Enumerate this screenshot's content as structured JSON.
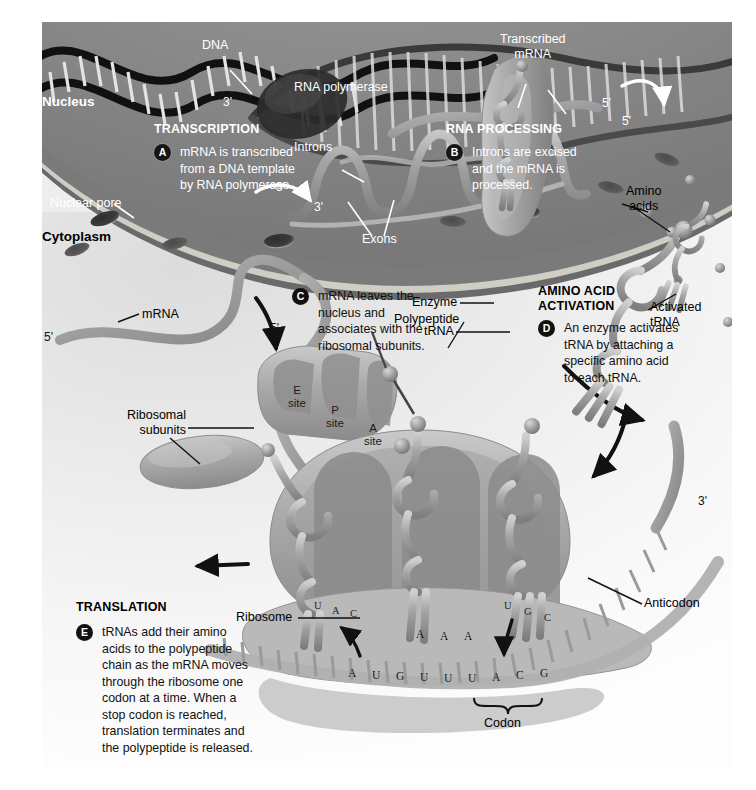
{
  "figure": {
    "background_color": "#ffffff",
    "palette": {
      "nucleus_fill": "#7b7b7b",
      "nuclear_envelope": "#cfcdc4",
      "cytoplasm_fill": "#ebebeb",
      "molecule_gray": "#9a9a9a",
      "text_dark": "#000000",
      "text_light": "#ffffff",
      "badge_fill": "#111111"
    }
  },
  "compartments": [
    {
      "name": "nucleus",
      "label": "Nucleus",
      "text_color": "#ffffff"
    },
    {
      "name": "cytoplasm",
      "label": "Cytoplasm",
      "text_color": "#000000"
    }
  ],
  "steps": [
    {
      "id": "A",
      "heading": "TRANSCRIPTION",
      "body": "mRNA is transcribed\nfrom a DNA template\nby RNA polymerase.",
      "on_dark": true
    },
    {
      "id": "B",
      "heading": "RNA PROCESSING",
      "body": "Introns are excised\nand the mRNA is\nprocessed.",
      "on_dark": true
    },
    {
      "id": "C",
      "heading": "",
      "body": "mRNA leaves the\nnucleus and\nassociates with the\nribosomal subunits.",
      "on_dark": false
    },
    {
      "id": "D",
      "heading": "AMINO ACID\nACTIVATION",
      "body": "An enzyme activates\ntRNA by attaching a\nspecific amino acid\nto each tRNA.",
      "on_dark": false
    },
    {
      "id": "E",
      "heading": "TRANSLATION",
      "body": "tRNAs add their amino\nacids to the polypeptide\nchain as the mRNA moves\nthrough the ribosome one\ncodon at a time. When a\nstop codon is reached,\ntranslation terminates and\nthe polypeptide is released.",
      "on_dark": false
    }
  ],
  "callouts": [
    {
      "name": "dna",
      "label": "DNA",
      "color": "#ffffff"
    },
    {
      "name": "rna-polymerase",
      "label": "RNA polymerase",
      "color": "#ffffff"
    },
    {
      "name": "transcribed-mrna",
      "label": "Transcribed\nmRNA",
      "color": "#ffffff"
    },
    {
      "name": "nuclear-pore",
      "label": "Nuclear pore",
      "color": "#ffffff"
    },
    {
      "name": "introns",
      "label": "Introns",
      "color": "#ffffff"
    },
    {
      "name": "exons",
      "label": "Exons",
      "color": "#ffffff"
    },
    {
      "name": "amino-acids",
      "label": "Amino\nacids",
      "color": "#000000"
    },
    {
      "name": "mrna",
      "label": "mRNA",
      "color": "#000000"
    },
    {
      "name": "ribosomal-subunits",
      "label": "Ribosomal\nsubunits",
      "color": "#000000"
    },
    {
      "name": "enzyme",
      "label": "Enzyme",
      "color": "#000000"
    },
    {
      "name": "trna",
      "label": "tRNA",
      "color": "#000000"
    },
    {
      "name": "activated-trna",
      "label": "Activated\ntRNA",
      "color": "#000000"
    },
    {
      "name": "polypeptide",
      "label": "Polypeptide",
      "color": "#000000"
    },
    {
      "name": "anticodon",
      "label": "Anticodon",
      "color": "#000000"
    },
    {
      "name": "ribosome",
      "label": "Ribosome",
      "color": "#000000"
    },
    {
      "name": "codon",
      "label": "Codon",
      "color": "#000000"
    }
  ],
  "ribosome_sites": [
    {
      "name": "e-site",
      "line1": "E",
      "line2": "site"
    },
    {
      "name": "p-site",
      "line1": "P",
      "line2": "site"
    },
    {
      "name": "a-site",
      "line1": "A",
      "line2": "site"
    }
  ],
  "prime_labels": [
    {
      "name": "dna-three-prime",
      "text": "3'",
      "color": "#ffffff"
    },
    {
      "name": "transcript-five-prime-1",
      "text": "5'",
      "color": "#ffffff"
    },
    {
      "name": "transcript-five-prime-2",
      "text": "5'",
      "color": "#ffffff"
    },
    {
      "name": "intron-three-prime-1",
      "text": "3'",
      "color": "#ffffff"
    },
    {
      "name": "intron-three-prime-2",
      "text": "3'",
      "color": "#ffffff"
    },
    {
      "name": "mrna-five-prime-left",
      "text": "5'",
      "color": "#000000"
    },
    {
      "name": "mrna-five-prime-ribosome",
      "text": "5'",
      "color": "#000000"
    },
    {
      "name": "mrna-three-prime-right",
      "text": "3'",
      "color": "#000000"
    }
  ],
  "sequence": {
    "mrna_label": "mRNA template strand",
    "mrna_bases": [
      "A",
      "U",
      "G",
      "U",
      "U",
      "U",
      "A",
      "C",
      "G"
    ],
    "codon_bracket_bases": [
      "A",
      "C",
      "G"
    ],
    "anticodons": [
      {
        "name": "anticodon-e-site",
        "bases": [
          "U",
          "A",
          "C"
        ]
      },
      {
        "name": "anticodon-p-site",
        "bases": [
          "A",
          "A",
          "A"
        ]
      },
      {
        "name": "anticodon-a-site",
        "bases": [
          "U",
          "G",
          "C"
        ]
      }
    ]
  }
}
